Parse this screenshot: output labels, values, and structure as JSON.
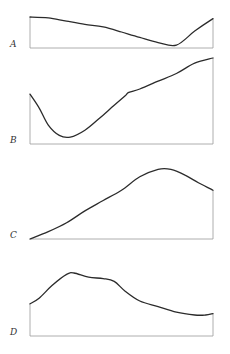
{
  "colors": {
    "curve": "#2b2b2b",
    "axis": "#9a9a9a",
    "label": "#333333",
    "background": "#ffffff"
  },
  "chart_data": [
    {
      "type": "line",
      "label": "A",
      "title": "",
      "xlabel": "",
      "ylabel": "",
      "grid": false,
      "frame": {
        "x0": 30,
        "x1": 213,
        "top": 16,
        "baseline": 48
      },
      "x": [
        0,
        0.1,
        0.2,
        0.3,
        0.4,
        0.5,
        0.6,
        0.7,
        0.8,
        0.9,
        1.0
      ],
      "values": [
        0.97,
        0.94,
        0.84,
        0.74,
        0.66,
        0.5,
        0.33,
        0.17,
        0.09,
        0.53,
        0.92
      ]
    },
    {
      "type": "line",
      "label": "B",
      "title": "",
      "xlabel": "",
      "ylabel": "",
      "grid": false,
      "frame": {
        "x0": 30,
        "x1": 213,
        "top": 58,
        "baseline": 144
      },
      "x": [
        0,
        0.05,
        0.1,
        0.16,
        0.22,
        0.3,
        0.38,
        0.46,
        0.52,
        0.54,
        0.6,
        0.7,
        0.8,
        0.9,
        1.0
      ],
      "values": [
        0.58,
        0.42,
        0.22,
        0.1,
        0.08,
        0.16,
        0.3,
        0.45,
        0.56,
        0.6,
        0.64,
        0.73,
        0.82,
        0.94,
        1.0
      ]
    },
    {
      "type": "line",
      "label": "C",
      "title": "",
      "xlabel": "",
      "ylabel": "",
      "grid": false,
      "frame": {
        "x0": 30,
        "x1": 213,
        "top": 165,
        "baseline": 239
      },
      "x": [
        0,
        0.1,
        0.2,
        0.3,
        0.4,
        0.5,
        0.6,
        0.7,
        0.77,
        0.85,
        0.92,
        1.0
      ],
      "values": [
        0.0,
        0.1,
        0.22,
        0.38,
        0.52,
        0.66,
        0.84,
        0.94,
        0.94,
        0.86,
        0.76,
        0.66
      ]
    },
    {
      "type": "line",
      "label": "D",
      "title": "",
      "xlabel": "",
      "ylabel": "",
      "grid": false,
      "frame": {
        "x0": 30,
        "x1": 213,
        "top": 266,
        "baseline": 336
      },
      "x": [
        0,
        0.05,
        0.12,
        0.2,
        0.24,
        0.32,
        0.4,
        0.46,
        0.52,
        0.6,
        0.7,
        0.8,
        0.9,
        0.96,
        1.0
      ],
      "values": [
        0.46,
        0.54,
        0.72,
        0.88,
        0.9,
        0.84,
        0.82,
        0.78,
        0.64,
        0.5,
        0.42,
        0.34,
        0.3,
        0.3,
        0.32
      ]
    }
  ]
}
